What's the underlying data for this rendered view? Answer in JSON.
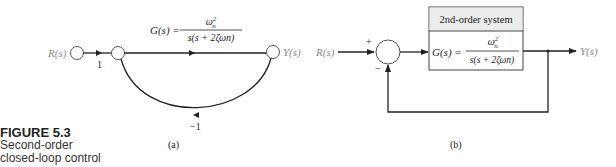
{
  "caption": {
    "figure_number": "FIGURE 5.3",
    "lines": [
      "Second-order",
      "closed-loop control",
      "system."
    ]
  },
  "diagram_a": {
    "input_label": "R(s)",
    "output_label": "Y(s)",
    "forward_gain_1": "1",
    "feedback_gain": "−1",
    "transfer_lhs": "G(s) =",
    "transfer_num": "ωn²",
    "transfer_den": "s(s + 2ζωn)",
    "sublabel": "(a)"
  },
  "diagram_b": {
    "input_label": "R(s)",
    "output_label": "Y(s)",
    "plus_sign": "+",
    "minus_sign": "−",
    "block_title": "2nd-order system",
    "transfer_lhs": "G(s) =",
    "transfer_num": "ωn²",
    "transfer_den": "s(s + 2ζωn)",
    "sublabel": "(b)"
  },
  "colors": {
    "line": "#222222",
    "label_gray": "#888888",
    "block_header_fill": "#ececec"
  }
}
